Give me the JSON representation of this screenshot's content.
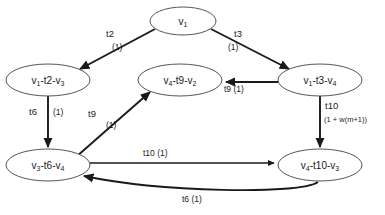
{
  "diagram": {
    "background_color": "#ffffff",
    "node_stroke_color": "#555555",
    "edge_color": "#1a1a1a",
    "nodes": [
      {
        "id": "v1",
        "label_html": "v<sub>1</sub>",
        "label_text": "v1",
        "cx": 183,
        "cy": 21,
        "rx": 33,
        "ry": 14
      },
      {
        "id": "v1-t2-v3",
        "label_html": "v<sub>1</sub>-t2-v<sub>3</sub>",
        "label_text": "v1-t2-v3",
        "cx": 48,
        "cy": 80,
        "rx": 42,
        "ry": 16
      },
      {
        "id": "v4-t9-v2",
        "label_html": "v<sub>4</sub>-t9-v<sub>2</sub>",
        "label_text": "v4-t9-v2",
        "cx": 180,
        "cy": 80,
        "rx": 42,
        "ry": 16
      },
      {
        "id": "v1-t3-v4",
        "label_html": "v<sub>1</sub>-t3-v<sub>4</sub>",
        "label_text": "v1-t3-v4",
        "cx": 320,
        "cy": 80,
        "rx": 42,
        "ry": 16
      },
      {
        "id": "v3-t6-v4",
        "label_html": "v<sub>3</sub>-t6-v<sub>4</sub>",
        "label_text": "v3-t6-v4",
        "cx": 48,
        "cy": 165,
        "rx": 42,
        "ry": 16
      },
      {
        "id": "v4-t10-v3",
        "label_html": "v<sub>4</sub>-t10-v<sub>3</sub>",
        "label_text": "v4-t10-v3",
        "cx": 320,
        "cy": 165,
        "rx": 42,
        "ry": 16
      }
    ],
    "edges": [
      {
        "id": "e-t2",
        "from": "v1",
        "to": "v1-t2-v3",
        "transition": "t2",
        "weight": "(1)"
      },
      {
        "id": "e-t3",
        "from": "v1",
        "to": "v1-t3-v4",
        "transition": "t3",
        "weight": "(1)"
      },
      {
        "id": "e-t9a",
        "from": "v1-t3-v4",
        "to": "v4-t9-v2",
        "transition": "t9",
        "weight": "(1)"
      },
      {
        "id": "e-t6a",
        "from": "v1-t2-v3",
        "to": "v3-t6-v4",
        "transition": "t6",
        "weight": "(1)"
      },
      {
        "id": "e-t9b",
        "from": "v3-t6-v4",
        "to": "v4-t9-v2",
        "transition": "t9",
        "weight": "(1)"
      },
      {
        "id": "e-t10a",
        "from": "v1-t3-v4",
        "to": "v4-t10-v3",
        "transition": "t10",
        "weight": "(1 + w(m+1))"
      },
      {
        "id": "e-t10b",
        "from": "v3-t6-v4",
        "to": "v4-t10-v3",
        "transition": "t10",
        "weight": "(1)"
      },
      {
        "id": "e-t6b",
        "from": "v4-t10-v3",
        "to": "v3-t6-v4",
        "transition": "t6",
        "weight": "(1)"
      }
    ],
    "edge_labels": {
      "t2_name": "t2",
      "t2_weight": "(1)",
      "t3_name": "t3",
      "t3_weight": "(1)",
      "t9_top": "t9 (1)",
      "t6_left_name": "t6",
      "t6_left_weight": "(1)",
      "t9_diag_name": "t9",
      "t9_diag_weight": "(1)",
      "t10_right_name": "t10",
      "t10_right_weight": "(1 + w(m+1))",
      "t10_bottom": "t10 (1)",
      "t6_bottom": "t6 (1)"
    }
  }
}
